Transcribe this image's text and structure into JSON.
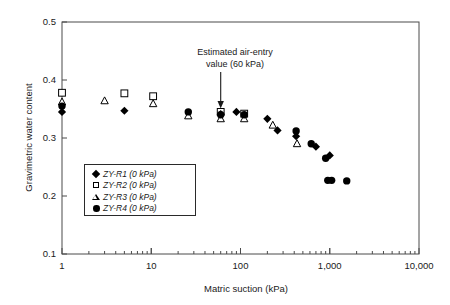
{
  "chart_data": {
    "type": "scatter",
    "title": "",
    "xlabel": "Matric suction (kPa)",
    "ylabel": "Gravimetric water content",
    "xscale": "log",
    "yscale": "linear",
    "xlim": [
      1,
      10000
    ],
    "ylim": [
      0.1,
      0.5
    ],
    "xticks": [
      1,
      10,
      100,
      1000,
      10000
    ],
    "xtick_labels": [
      "1",
      "10",
      "100",
      "1,000",
      "10,000"
    ],
    "yticks": [
      0.1,
      0.2,
      0.3,
      0.4,
      0.5
    ],
    "ytick_labels": [
      "0.1",
      "0.2",
      "0.3",
      "0.4",
      "0.5"
    ],
    "grid": false,
    "legend_position": "lower-left-inside",
    "annotations": [
      {
        "text_line1": "Estimated air-entry",
        "text_line2": "value (60 kPa)",
        "points_to_x": 60,
        "points_to_y": 0.345,
        "arrow": "down"
      }
    ],
    "series": [
      {
        "name": "ZY-R1 (0 kPa)",
        "marker": "filled-diamond",
        "color": "#000000",
        "points": [
          {
            "x": 1.0,
            "y": 0.345
          },
          {
            "x": 5.0,
            "y": 0.347
          },
          {
            "x": 60,
            "y": 0.341
          },
          {
            "x": 90,
            "y": 0.345
          },
          {
            "x": 200,
            "y": 0.333
          },
          {
            "x": 260,
            "y": 0.313
          },
          {
            "x": 420,
            "y": 0.303
          },
          {
            "x": 700,
            "y": 0.285
          },
          {
            "x": 1000,
            "y": 0.27
          }
        ]
      },
      {
        "name": "ZY-R2 (0 kPa)",
        "marker": "open-square",
        "color": "#000000",
        "points": [
          {
            "x": 1.0,
            "y": 0.378
          },
          {
            "x": 5.0,
            "y": 0.377
          },
          {
            "x": 10.5,
            "y": 0.372
          },
          {
            "x": 60,
            "y": 0.345
          },
          {
            "x": 110,
            "y": 0.342
          }
        ]
      },
      {
        "name": "ZY-R3 (0 kPa)",
        "marker": "open-triangle",
        "color": "#000000",
        "points": [
          {
            "x": 1.0,
            "y": 0.362
          },
          {
            "x": 3.0,
            "y": 0.364
          },
          {
            "x": 10.5,
            "y": 0.359
          },
          {
            "x": 26,
            "y": 0.338
          },
          {
            "x": 60,
            "y": 0.333
          },
          {
            "x": 110,
            "y": 0.333
          },
          {
            "x": 230,
            "y": 0.322
          },
          {
            "x": 430,
            "y": 0.29
          }
        ]
      },
      {
        "name": "ZY-R4 (0 kPa)",
        "marker": "filled-circle",
        "color": "#000000",
        "points": [
          {
            "x": 1.0,
            "y": 0.355
          },
          {
            "x": 26,
            "y": 0.345
          },
          {
            "x": 60,
            "y": 0.34
          },
          {
            "x": 110,
            "y": 0.34
          },
          {
            "x": 420,
            "y": 0.312
          },
          {
            "x": 620,
            "y": 0.29
          },
          {
            "x": 900,
            "y": 0.265
          },
          {
            "x": 950,
            "y": 0.227
          },
          {
            "x": 1050,
            "y": 0.227
          },
          {
            "x": 1550,
            "y": 0.226
          }
        ]
      }
    ]
  },
  "legend": {
    "items": [
      {
        "label": "ZY-R1 (0 kPa)",
        "marker": "filled-diamond"
      },
      {
        "label": "ZY-R2 (0 kPa)",
        "marker": "open-square"
      },
      {
        "label": "ZY-R3 (0 kPa)",
        "marker": "open-triangle"
      },
      {
        "label": "ZY-R4 (0 kPa)",
        "marker": "filled-circle"
      }
    ]
  }
}
